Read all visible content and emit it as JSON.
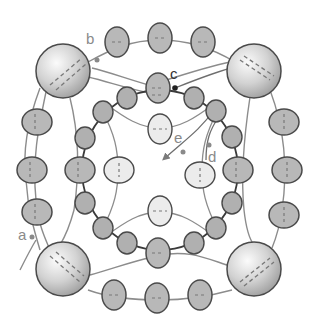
{
  "diagram": {
    "colors": {
      "cell_fill": "#b8b8b8",
      "cell_stroke": "#4a4a4a",
      "pale_cell_fill": "#ececec",
      "sphere_light": "#f6f6f6",
      "sphere_dark": "#a9a9a9",
      "strand": "#8c8c8c",
      "inner_ring": "#3a3a3a",
      "label": "#8a8a8a"
    },
    "labels": {
      "a": "a",
      "b": "b",
      "c": "c",
      "d": "d",
      "e": "e"
    }
  }
}
